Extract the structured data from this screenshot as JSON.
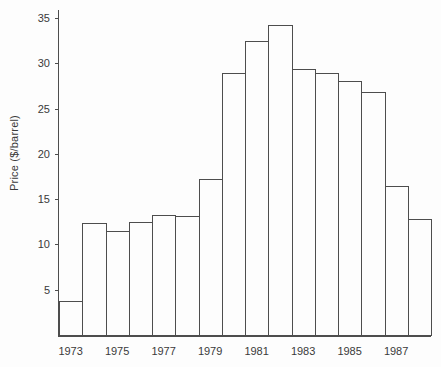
{
  "chart_data": {
    "type": "bar",
    "title": "",
    "xlabel": "",
    "ylabel": "Price ($/barrel)",
    "categories": [
      "1973",
      "1974",
      "1975",
      "1976",
      "1977",
      "1978",
      "1979",
      "1980",
      "1981",
      "1982",
      "1983",
      "1984",
      "1985",
      "1986",
      "1987",
      "1988"
    ],
    "values": [
      3.9,
      12.5,
      11.6,
      12.6,
      13.4,
      13.3,
      17.3,
      29.0,
      32.6,
      34.4,
      29.5,
      29.0,
      28.2,
      27.0,
      16.6,
      12.9
    ],
    "ylim": [
      0,
      36
    ],
    "yticks": [
      5,
      10,
      15,
      20,
      25,
      30,
      35
    ],
    "xtick_labels": [
      "1973",
      "1975",
      "1977",
      "1979",
      "1981",
      "1983",
      "1985",
      "1987"
    ],
    "xtick_bar_indexes": [
      0,
      2,
      4,
      6,
      8,
      10,
      12,
      14
    ],
    "grid": false,
    "legend": "none",
    "bar_fill": "#fdfdfd",
    "line_color": "#4d4d4d",
    "text_color": "#3a3a3a",
    "background": "#fdfdfd"
  }
}
